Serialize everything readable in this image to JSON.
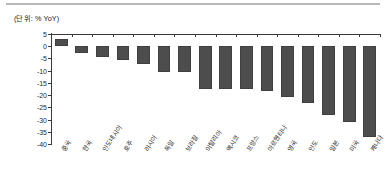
{
  "figure": {
    "unit_label": "(단위: % YoY)"
  },
  "chart_data": {
    "type": "bar",
    "title": "",
    "subtitle": "",
    "xlabel": "",
    "ylabel": "",
    "unit": "% YoY",
    "grid": false,
    "legend": "none",
    "ylim": [
      -40,
      5
    ],
    "yticks": [
      5,
      0,
      -5,
      -10,
      -15,
      -20,
      -25,
      -30,
      -35,
      -40
    ],
    "ytick_labels": [
      "5",
      "0",
      "-5",
      "-10",
      "-15",
      "-20",
      "-25",
      "-30",
      "-35",
      "-40"
    ],
    "categories": [
      "중국",
      "한국",
      "인도네시아",
      "호주",
      "러시아",
      "독일",
      "브라질",
      "이탈리아",
      "멕시코",
      "프랑스",
      "아르헨티나",
      "영국",
      "인도",
      "일본",
      "미국",
      "캐나다"
    ],
    "values": [
      2.8,
      -2.7,
      -4.6,
      -5.7,
      -7.3,
      -10.4,
      -10.6,
      -17.4,
      -17.6,
      -17.6,
      -18.4,
      -20.9,
      -23.2,
      -28.3,
      -30.8,
      -37.2
    ],
    "bar_color": "#4d4d4d"
  }
}
